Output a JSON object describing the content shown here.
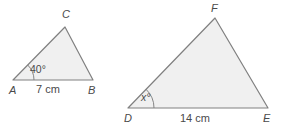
{
  "figure": {
    "background_color": "#ffffff",
    "fill_color": "#f0f0f0",
    "stroke_color": "#808080",
    "text_color": "#4a4a4a",
    "stroke_width": 1.2
  },
  "small_triangle": {
    "name": "triangle-abc",
    "vertices": {
      "A": {
        "label": "A",
        "x": 13,
        "y": 80,
        "label_x": 9,
        "label_y": 94
      },
      "B": {
        "label": "B",
        "x": 93,
        "y": 80,
        "label_x": 88,
        "label_y": 94
      },
      "C": {
        "label": "C",
        "x": 65,
        "y": 27,
        "label_x": 62,
        "label_y": 18
      }
    },
    "angle": {
      "label": "40°",
      "value": 40,
      "unit": "degrees",
      "at_vertex": "A",
      "label_x": 30,
      "label_y": 73
    },
    "base": {
      "label": "7 cm",
      "value": 7,
      "unit": "cm",
      "side": "AB",
      "label_x": 36,
      "label_y": 93
    }
  },
  "large_triangle": {
    "name": "triangle-def",
    "vertices": {
      "D": {
        "label": "D",
        "x": 128,
        "y": 108,
        "label_x": 124,
        "label_y": 122
      },
      "E": {
        "label": "E",
        "x": 268,
        "y": 108,
        "label_x": 263,
        "label_y": 122
      },
      "F": {
        "label": "F",
        "x": 215,
        "y": 18,
        "label_x": 211,
        "label_y": 12
      }
    },
    "angle": {
      "label": "x°",
      "value": "x",
      "unit": "degrees",
      "at_vertex": "D",
      "label_x": 141,
      "label_y": 101
    },
    "base": {
      "label": "14 cm",
      "value": 14,
      "unit": "cm",
      "side": "DE",
      "label_x": 180,
      "label_y": 122
    }
  }
}
